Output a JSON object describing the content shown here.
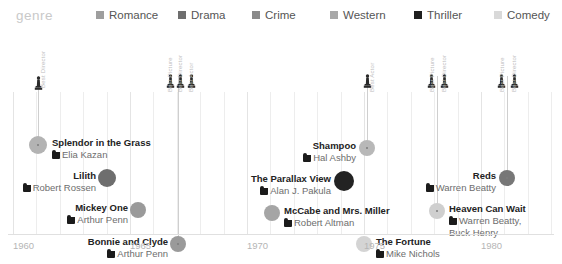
{
  "legend": {
    "title": "genre",
    "items": [
      {
        "label": "Romance",
        "color": "#9e9e9e",
        "x": 96
      },
      {
        "label": "Drama",
        "color": "#6e6e6e",
        "x": 178
      },
      {
        "label": "Crime",
        "color": "#8a8a8a",
        "x": 252
      },
      {
        "label": "Western",
        "color": "#a8a8a8",
        "x": 330
      },
      {
        "label": "Thriller",
        "color": "#1f1f1f",
        "x": 414
      },
      {
        "label": "Comedy",
        "color": "#d9d9d9",
        "x": 494
      }
    ]
  },
  "axis": {
    "ticks": [
      "1960",
      "1965",
      "1970",
      "1975",
      "1980"
    ],
    "tick_x": [
      13,
      130,
      247,
      364,
      481
    ],
    "year_min": 1960,
    "year_max": 1983,
    "px_per_year": 23.4
  },
  "awards": [
    {
      "name": "splendor-award",
      "x": 38,
      "stem_top": 46,
      "stem_bottom": 112,
      "statuettes": [
        {
          "x": 34,
          "y": 46
        }
      ],
      "labels": [
        {
          "text": "Best Director",
          "x": 40,
          "y": 58
        }
      ]
    },
    {
      "name": "bonnie-award",
      "x": 178,
      "stem_top": 46,
      "stem_bottom": 214,
      "statuettes": [
        {
          "x": 166,
          "y": 44
        },
        {
          "x": 176,
          "y": 44
        },
        {
          "x": 187,
          "y": 44
        }
      ],
      "labels": [
        {
          "text": "Best Picture",
          "x": 167,
          "y": 62
        },
        {
          "text": "Best Director",
          "x": 177,
          "y": 62
        },
        {
          "text": "Best Actor",
          "x": 188,
          "y": 62
        }
      ]
    },
    {
      "name": "shampoo-award",
      "x": 367,
      "stem_top": 46,
      "stem_bottom": 117,
      "statuettes": [
        {
          "x": 363,
          "y": 44
        }
      ],
      "labels": [
        {
          "text": "Best Actor",
          "x": 369,
          "y": 62
        }
      ]
    },
    {
      "name": "heaven-award",
      "x": 437,
      "stem_top": 46,
      "stem_bottom": 178,
      "statuettes": [
        {
          "x": 427,
          "y": 44
        },
        {
          "x": 440,
          "y": 44
        }
      ],
      "labels": [
        {
          "text": "Best Picture",
          "x": 429,
          "y": 62
        },
        {
          "text": "Best Director",
          "x": 441,
          "y": 62
        }
      ]
    },
    {
      "name": "reds-award",
      "x": 507,
      "stem_top": 46,
      "stem_bottom": 148,
      "statuettes": [
        {
          "x": 497,
          "y": 44
        },
        {
          "x": 510,
          "y": 44
        }
      ],
      "labels": [
        {
          "text": "Best Picture",
          "x": 499,
          "y": 62
        },
        {
          "text": "Best Director",
          "x": 511,
          "y": 62
        }
      ]
    }
  ],
  "films": [
    {
      "title": "Splendor in the Grass",
      "director": "Elia Kazan",
      "director2": "",
      "genre": "Romance",
      "color": "#b3b3b3",
      "dot_x": 38,
      "dot_y": 115,
      "dot_r": 9,
      "has_core": true,
      "align": "left",
      "text_x": 52,
      "text_y": 107
    },
    {
      "title": "Lilith",
      "director": "Robert Rossen",
      "director2": "",
      "genre": "Drama",
      "color": "#6e6e6e",
      "dot_x": 107,
      "dot_y": 148,
      "dot_r": 9,
      "has_core": false,
      "align": "right",
      "text_x": 96,
      "text_y": 140
    },
    {
      "title": "Mickey One",
      "director": "Arthur Penn",
      "director2": "",
      "genre": "Crime",
      "color": "#9a9a9a",
      "dot_x": 138,
      "dot_y": 180,
      "dot_r": 8,
      "has_core": false,
      "align": "right",
      "text_x": 128,
      "text_y": 172
    },
    {
      "title": "Bonnie and Clyde",
      "director": "Arthur Penn",
      "director2": "",
      "genre": "Crime",
      "color": "#9a9a9a",
      "dot_x": 178,
      "dot_y": 214,
      "dot_r": 8,
      "has_core": true,
      "align": "right",
      "text_x": 168,
      "text_y": 206
    },
    {
      "title": "Shampoo",
      "director": "Hal Ashby",
      "director2": "",
      "genre": "Comedy",
      "color": "#b8b8b8",
      "dot_x": 367,
      "dot_y": 118,
      "dot_r": 8,
      "has_core": true,
      "align": "right",
      "text_x": 356,
      "text_y": 110
    },
    {
      "title": "The Parallax View",
      "director": "Alan J. Pakula",
      "director2": "",
      "genre": "Thriller",
      "color": "#232323",
      "dot_x": 344,
      "dot_y": 151,
      "dot_r": 10,
      "has_core": false,
      "align": "right",
      "text_x": 331,
      "text_y": 143
    },
    {
      "title": "McCabe and Mrs. Miller",
      "director": "Robert Altman",
      "director2": "",
      "genre": "Western",
      "color": "#a5a5a5",
      "dot_x": 272,
      "dot_y": 183,
      "dot_r": 8,
      "has_core": false,
      "align": "left",
      "text_x": 284,
      "text_y": 175
    },
    {
      "title": "The Fortune",
      "director": "Mike Nichols",
      "director2": "",
      "genre": "Comedy",
      "color": "#d4d4d4",
      "dot_x": 364,
      "dot_y": 214,
      "dot_r": 8,
      "has_core": false,
      "align": "left",
      "text_x": 376,
      "text_y": 206
    },
    {
      "title": "Heaven Can Wait",
      "director": "Warren Beatty,",
      "director2": "Buck Henry",
      "genre": "Comedy",
      "color": "#cfcfcf",
      "dot_x": 437,
      "dot_y": 181,
      "dot_r": 8,
      "has_core": true,
      "align": "left",
      "text_x": 449,
      "text_y": 173
    },
    {
      "title": "Reds",
      "director": "Warren Beatty",
      "director2": "",
      "genre": "Drama",
      "color": "#777777",
      "dot_x": 507,
      "dot_y": 148,
      "dot_r": 8,
      "has_core": true,
      "align": "right",
      "text_x": 496,
      "text_y": 140
    }
  ]
}
